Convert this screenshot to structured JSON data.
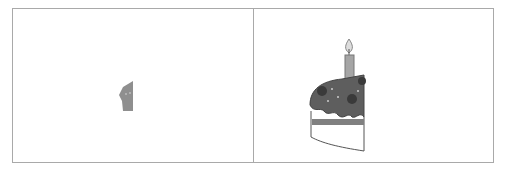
{
  "panels": [
    {
      "id": "left",
      "content": "cupcake-fragment",
      "color": "#8a8a8a"
    },
    {
      "id": "right",
      "content": "birthday-cake-half",
      "frosting": "#5a5a5a",
      "candle": "#9a9a9a",
      "stripe": "#7a7a7a"
    }
  ]
}
